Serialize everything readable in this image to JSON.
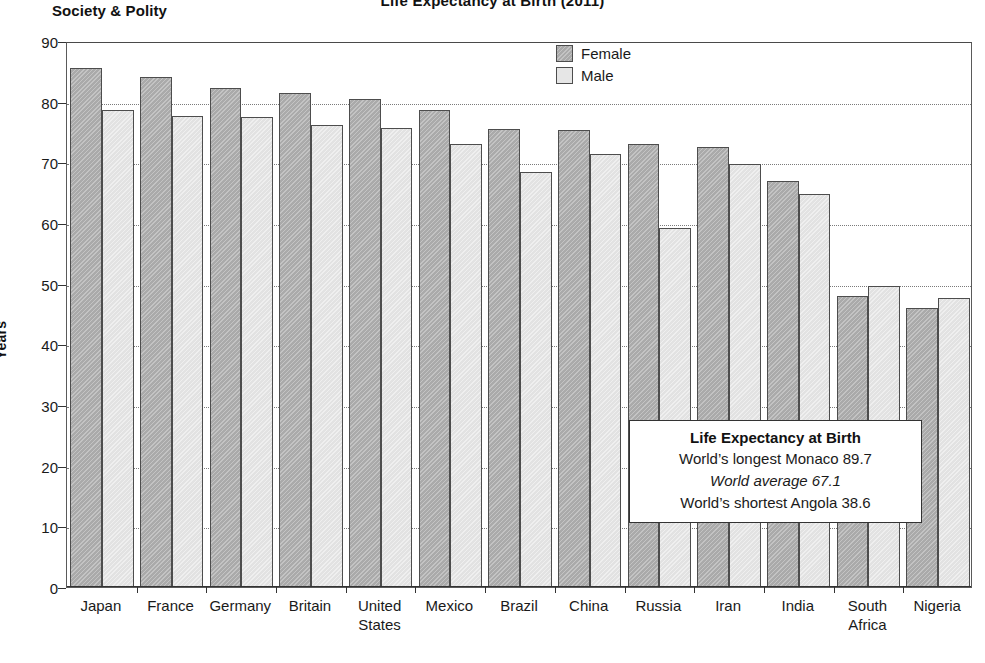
{
  "header": {
    "title": "Life Expectancy at Birth (2011)",
    "section_label": "Society & Polity"
  },
  "legend": {
    "position": "top-center",
    "items": [
      {
        "label": "Female",
        "color": "#aaaaaa"
      },
      {
        "label": "Male",
        "color": "#e6e6e6"
      }
    ]
  },
  "callout": {
    "title": "Life Expectancy at Birth",
    "line_longest": "World’s longest Monaco 89.7",
    "line_average": "World average 67.1",
    "line_shortest": "World’s shortest Angola 38.6"
  },
  "axes": {
    "y_title": "Years",
    "y_ticks": [
      "0",
      "10",
      "20",
      "30",
      "40",
      "50",
      "60",
      "70",
      "80",
      "90"
    ]
  },
  "chart_data": {
    "type": "bar",
    "title": "Life Expectancy at Birth (2011)",
    "xlabel": "",
    "ylabel": "Years",
    "ylim": [
      0,
      90
    ],
    "ytick_step": 10,
    "grid": true,
    "legend_position": "top-center",
    "categories": [
      "Japan",
      "France",
      "Germany",
      "Britain",
      "United\nStates",
      "Mexico",
      "Brazil",
      "China",
      "Russia",
      "Iran",
      "India",
      "South\nAfrica",
      "Nigeria"
    ],
    "series": [
      {
        "name": "Female",
        "color": "#aaaaaa",
        "values": [
          85.5,
          84.1,
          82.2,
          81.4,
          80.5,
          78.7,
          75.5,
          75.3,
          73.1,
          72.5,
          67.0,
          48.0,
          46.0
        ]
      },
      {
        "name": "Male",
        "color": "#e6e6e6",
        "values": [
          78.7,
          77.6,
          77.5,
          76.2,
          75.6,
          73.1,
          68.4,
          71.3,
          59.1,
          69.8,
          64.8,
          49.7,
          47.6
        ]
      }
    ],
    "annotations": [
      "World’s longest Monaco 89.7",
      "World average 67.1",
      "World’s shortest Angola 38.6"
    ]
  }
}
